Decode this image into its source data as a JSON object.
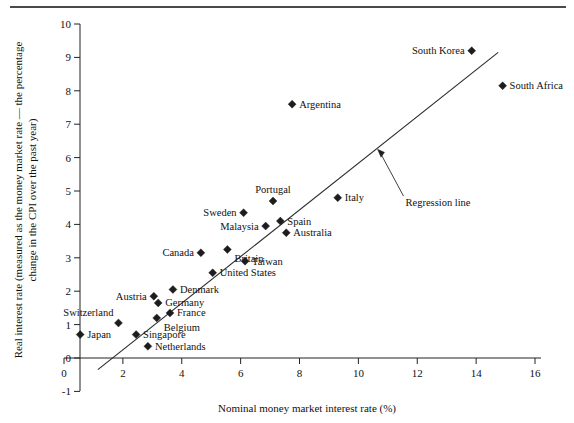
{
  "chart_data": {
    "type": "scatter",
    "title": "",
    "xlabel": "Nominal money market interest rate (%)",
    "ylabel": "Real interest rate (measured as the money market rate — the percentage change in the CPI over the past year)",
    "ylabel_line1": "Real interest rate (measured as the money market rate — the percentage",
    "ylabel_line2": "change in the CPI over the past year)",
    "xlim": [
      0,
      16
    ],
    "ylim": [
      -1,
      10
    ],
    "xticks": [
      "0",
      "2",
      "4",
      "6",
      "8",
      "10",
      "12",
      "14",
      "16"
    ],
    "xtick_values": [
      0,
      2,
      4,
      6,
      8,
      10,
      12,
      14,
      16
    ],
    "yticks": [
      "10",
      "9",
      "8",
      "7",
      "6",
      "5",
      "4",
      "3",
      "2",
      "1",
      "0",
      "-1"
    ],
    "ytick_values": [
      10,
      9,
      8,
      7,
      6,
      5,
      4,
      3,
      2,
      1,
      0,
      -1
    ],
    "grid": false,
    "legend": "none",
    "marker_shape": "diamond",
    "marker_color": "#1d1d1d",
    "line_color": "#2b2b2b",
    "points": [
      {
        "label": "Japan",
        "x": 0.55,
        "y": 0.7,
        "label_pos": "right"
      },
      {
        "label": "Switzerland",
        "x": 1.85,
        "y": 1.05,
        "label_pos": "left-above"
      },
      {
        "label": "Singapore",
        "x": 2.45,
        "y": 0.7,
        "label_pos": "right"
      },
      {
        "label": "Netherlands",
        "x": 2.85,
        "y": 0.35,
        "label_pos": "right"
      },
      {
        "label": "Austria",
        "x": 3.05,
        "y": 1.85,
        "label_pos": "left"
      },
      {
        "label": "Germany",
        "x": 3.2,
        "y": 1.65,
        "label_pos": "right"
      },
      {
        "label": "Belgium",
        "x": 3.15,
        "y": 1.2,
        "label_pos": "right-below"
      },
      {
        "label": "France",
        "x": 3.6,
        "y": 1.35,
        "label_pos": "right"
      },
      {
        "label": "Denmark",
        "x": 3.7,
        "y": 2.05,
        "label_pos": "right"
      },
      {
        "label": "Canada",
        "x": 4.65,
        "y": 3.15,
        "label_pos": "left"
      },
      {
        "label": "United States",
        "x": 5.05,
        "y": 2.55,
        "label_pos": "right"
      },
      {
        "label": "Britain",
        "x": 5.55,
        "y": 3.25,
        "label_pos": "right-below"
      },
      {
        "label": "Sweden",
        "x": 6.1,
        "y": 4.35,
        "label_pos": "left"
      },
      {
        "label": "Taiwan",
        "x": 6.15,
        "y": 2.9,
        "label_pos": "right"
      },
      {
        "label": "Malaysia",
        "x": 6.85,
        "y": 3.95,
        "label_pos": "left"
      },
      {
        "label": "Portugal",
        "x": 7.1,
        "y": 4.7,
        "label_pos": "above"
      },
      {
        "label": "Spain",
        "x": 7.35,
        "y": 4.1,
        "label_pos": "right"
      },
      {
        "label": "Australia",
        "x": 7.55,
        "y": 3.75,
        "label_pos": "right"
      },
      {
        "label": "Argentina",
        "x": 7.75,
        "y": 7.6,
        "label_pos": "right"
      },
      {
        "label": "Italy",
        "x": 9.3,
        "y": 4.8,
        "label_pos": "right"
      },
      {
        "label": "South Korea",
        "x": 13.85,
        "y": 9.2,
        "label_pos": "left"
      },
      {
        "label": "South Africa",
        "x": 14.9,
        "y": 8.15,
        "label_pos": "right"
      }
    ],
    "regression_line": {
      "label": "Regression line",
      "x_start": 1.15,
      "y_start": -0.35,
      "x_end": 14.75,
      "y_end": 9.15
    },
    "annotation": {
      "text": "Regression line",
      "arrow_tip_x": 10.65,
      "arrow_tip_y": 6.25
    }
  }
}
